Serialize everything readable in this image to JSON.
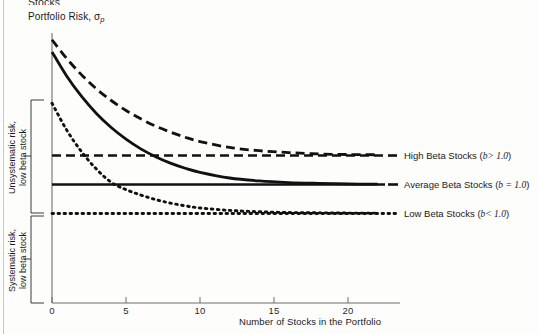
{
  "figure": {
    "clipped_heading": "Stocks",
    "y_axis_label": "Portfolio Risk, σ",
    "y_axis_label_sub": "p",
    "x_axis_label": "Number of Stocks in the Portfolio"
  },
  "axis": {
    "x_ticks": [
      "0",
      "5",
      "10",
      "15",
      "20"
    ],
    "x_tick_values": [
      0,
      5,
      10,
      15,
      20
    ]
  },
  "brackets": [
    {
      "label_line1": "Unsystematic risk,",
      "label_line2": "low beta stock"
    },
    {
      "label_line1": "Systematic risk,",
      "label_line2": "low beta stock"
    }
  ],
  "legend": [
    {
      "name": "High Beta Stocks",
      "condition": "b> 1.0",
      "style": "dashed"
    },
    {
      "name": "Average Beta Stocks",
      "condition": "b = 1.0",
      "style": "solid"
    },
    {
      "name": "Low Beta Stocks",
      "condition": "b< 1.0",
      "style": "dotted"
    }
  ],
  "colors": {
    "ink": "#1a1a1a",
    "axis": "#6f6f6f",
    "background": "#fdfdfb"
  },
  "chart_data": {
    "type": "line",
    "title": "",
    "xlabel": "Number of Stocks in the Portfolio",
    "ylabel": "Portfolio Risk, σp",
    "xlim": [
      0,
      22.5
    ],
    "ylim": [
      0,
      1
    ],
    "grid": false,
    "legend_position": "right",
    "x": [
      0,
      1,
      2,
      3,
      4,
      5,
      6,
      7,
      8,
      9,
      10,
      12,
      14,
      16,
      18,
      20,
      22
    ],
    "series": [
      {
        "name": "High Beta Stocks",
        "condition": "b > 1.0",
        "style": "dashed",
        "asymptote": 0.548,
        "values": [
          0.975,
          0.905,
          0.845,
          0.793,
          0.75,
          0.713,
          0.682,
          0.655,
          0.633,
          0.614,
          0.598,
          0.576,
          0.564,
          0.557,
          0.552,
          0.55,
          0.549
        ]
      },
      {
        "name": "Average Beta Stocks",
        "condition": "b = 1.0",
        "style": "solid",
        "asymptote": 0.44,
        "values": [
          0.93,
          0.84,
          0.765,
          0.702,
          0.65,
          0.607,
          0.571,
          0.542,
          0.518,
          0.499,
          0.484,
          0.463,
          0.452,
          0.446,
          0.443,
          0.441,
          0.44
        ]
      },
      {
        "name": "Low Beta Stocks",
        "condition": "b < 1.0",
        "style": "dotted",
        "asymptote": 0.333,
        "values": [
          0.74,
          0.64,
          0.56,
          0.496,
          0.447,
          0.42,
          0.4,
          0.383,
          0.37,
          0.36,
          0.352,
          0.343,
          0.338,
          0.335,
          0.334,
          0.333,
          0.333
        ]
      }
    ],
    "asymptote_lines": [
      {
        "name": "High Beta Stocks asymptote",
        "y": 0.548,
        "style": "dashed"
      },
      {
        "name": "Average Beta Stocks asymptote",
        "y": 0.44,
        "style": "solid"
      },
      {
        "name": "Low Beta Stocks asymptote",
        "y": 0.333,
        "style": "dotted"
      }
    ],
    "annotations": [
      {
        "text": "Unsystematic risk, low beta stock",
        "type": "bracket",
        "y_range": [
          0.333,
          0.745
        ]
      },
      {
        "text": "Systematic risk, low beta stock",
        "type": "bracket",
        "y_range": [
          0.0,
          0.327
        ]
      }
    ]
  }
}
